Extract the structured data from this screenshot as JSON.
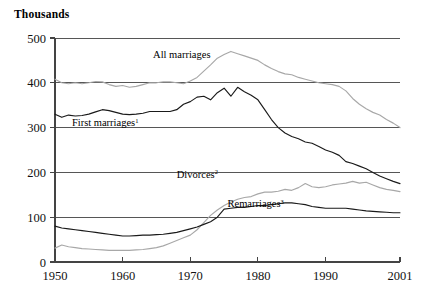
{
  "chart_data": {
    "type": "line",
    "title": "",
    "unit_label": "Thousands",
    "xlabel": "",
    "ylabel": "Thousands",
    "grid": true,
    "legend_position": "inline-annotations",
    "xlim": [
      1950,
      2001
    ],
    "ylim": [
      0,
      500
    ],
    "yticks": [
      0,
      100,
      200,
      300,
      400,
      500
    ],
    "xticks": [
      1950,
      1960,
      1970,
      1980,
      1990,
      2001
    ],
    "xtick_labels": [
      "1950",
      "1960",
      "1970",
      "1980",
      "1990",
      "2001"
    ],
    "ytick_labels": [
      "0",
      "100",
      "200",
      "300",
      "400",
      "500"
    ],
    "annotations": [
      {
        "text": "All marriages",
        "superscript": "",
        "x": 1964.5,
        "y": 455
      },
      {
        "text": "First marriages",
        "superscript": "1",
        "x": 1952.5,
        "y": 303
      },
      {
        "text": "Divorces",
        "superscript": "2",
        "x": 1968.0,
        "y": 188
      },
      {
        "text": "Remarriages",
        "superscript": "3",
        "x": 1975.5,
        "y": 122
      }
    ],
    "series": [
      {
        "name": "All marriages",
        "color": "#a8a8a8",
        "x": [
          1950,
          1951,
          1952,
          1953,
          1954,
          1955,
          1956,
          1957,
          1958,
          1959,
          1960,
          1961,
          1962,
          1963,
          1964,
          1965,
          1966,
          1967,
          1968,
          1969,
          1970,
          1971,
          1972,
          1973,
          1974,
          1975,
          1976,
          1977,
          1978,
          1979,
          1980,
          1981,
          1982,
          1983,
          1984,
          1985,
          1986,
          1987,
          1988,
          1989,
          1990,
          1991,
          1992,
          1993,
          1994,
          1995,
          1996,
          1997,
          1998,
          1999,
          2000,
          2001
        ],
        "values": [
          408,
          400,
          398,
          400,
          398,
          400,
          403,
          402,
          396,
          392,
          394,
          390,
          392,
          396,
          400,
          400,
          402,
          402,
          400,
          398,
          404,
          412,
          426,
          440,
          455,
          463,
          470,
          465,
          460,
          455,
          450,
          440,
          432,
          425,
          420,
          418,
          412,
          408,
          404,
          400,
          398,
          396,
          392,
          382,
          365,
          352,
          342,
          334,
          328,
          318,
          310,
          300
        ]
      },
      {
        "name": "First marriages",
        "color": "#1a1a1a",
        "x": [
          1950,
          1951,
          1952,
          1953,
          1954,
          1955,
          1956,
          1957,
          1958,
          1959,
          1960,
          1961,
          1962,
          1963,
          1964,
          1965,
          1966,
          1967,
          1968,
          1969,
          1970,
          1971,
          1972,
          1973,
          1974,
          1975,
          1976,
          1977,
          1978,
          1979,
          1980,
          1981,
          1982,
          1983,
          1984,
          1985,
          1986,
          1987,
          1988,
          1989,
          1990,
          1991,
          1992,
          1993,
          1994,
          1995,
          1996,
          1997,
          1998,
          1999,
          2000,
          2001
        ],
        "values": [
          330,
          323,
          328,
          326,
          327,
          330,
          335,
          340,
          338,
          334,
          330,
          329,
          330,
          332,
          336,
          336,
          336,
          336,
          340,
          352,
          358,
          368,
          370,
          362,
          378,
          388,
          370,
          390,
          380,
          372,
          362,
          340,
          318,
          300,
          288,
          280,
          275,
          268,
          265,
          258,
          250,
          245,
          238,
          224,
          220,
          214,
          208,
          200,
          192,
          186,
          180,
          175
        ]
      },
      {
        "name": "Divorces",
        "color": "#a8a8a8",
        "x": [
          1950,
          1951,
          1952,
          1953,
          1954,
          1955,
          1956,
          1957,
          1958,
          1959,
          1960,
          1961,
          1962,
          1963,
          1964,
          1965,
          1966,
          1967,
          1968,
          1969,
          1970,
          1971,
          1972,
          1973,
          1974,
          1975,
          1976,
          1977,
          1978,
          1979,
          1980,
          1981,
          1982,
          1983,
          1984,
          1985,
          1986,
          1987,
          1988,
          1989,
          1990,
          1991,
          1992,
          1993,
          1994,
          1995,
          1996,
          1997,
          1998,
          1999,
          2000,
          2001
        ],
        "values": [
          31,
          38,
          34,
          32,
          30,
          29,
          28,
          27,
          26,
          26,
          26,
          26,
          27,
          28,
          30,
          32,
          36,
          42,
          48,
          54,
          60,
          72,
          88,
          104,
          116,
          126,
          134,
          140,
          144,
          146,
          152,
          156,
          156,
          158,
          162,
          160,
          166,
          175,
          168,
          166,
          168,
          172,
          174,
          176,
          180,
          176,
          178,
          172,
          166,
          162,
          160,
          157
        ]
      },
      {
        "name": "Remarriages",
        "color": "#1a1a1a",
        "x": [
          1950,
          1951,
          1952,
          1953,
          1954,
          1955,
          1956,
          1957,
          1958,
          1959,
          1960,
          1961,
          1962,
          1963,
          1964,
          1965,
          1966,
          1967,
          1968,
          1969,
          1970,
          1971,
          1972,
          1973,
          1974,
          1975,
          1976,
          1977,
          1978,
          1979,
          1980,
          1981,
          1982,
          1983,
          1984,
          1985,
          1986,
          1987,
          1988,
          1989,
          1990,
          1991,
          1992,
          1993,
          1994,
          1995,
          1996,
          1997,
          1998,
          1999,
          2000,
          2001
        ],
        "values": [
          80,
          76,
          74,
          72,
          70,
          68,
          66,
          64,
          62,
          60,
          58,
          58,
          59,
          60,
          60,
          61,
          62,
          64,
          66,
          70,
          74,
          78,
          84,
          90,
          100,
          118,
          120,
          122,
          122,
          124,
          126,
          126,
          128,
          130,
          132,
          132,
          130,
          128,
          124,
          122,
          120,
          120,
          120,
          120,
          118,
          116,
          114,
          113,
          112,
          111,
          110,
          110
        ]
      }
    ]
  }
}
